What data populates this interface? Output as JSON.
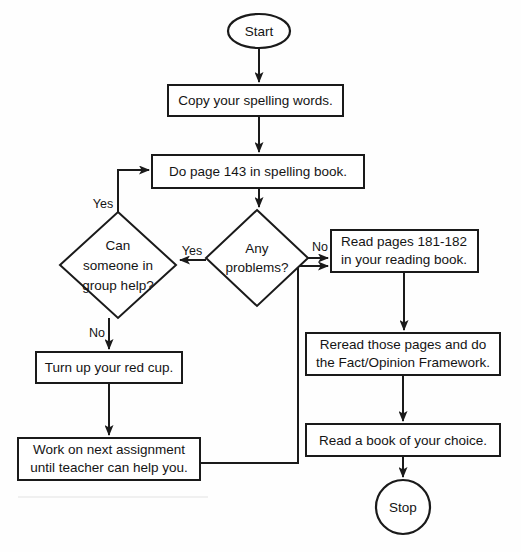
{
  "diagram": {
    "type": "flowchart",
    "orientation": "top-to-bottom",
    "background_color": "#fefefe",
    "line_color": "#1a1a1a",
    "fill_color": "#ffffff"
  },
  "nodes": [
    {
      "id": "start",
      "shape": "ellipse",
      "label": "Start",
      "cx": 259,
      "cy": 31,
      "rx": 31,
      "ry": 17
    },
    {
      "id": "copy-words",
      "shape": "rectangle",
      "label": "Copy your spelling words.",
      "x": 168,
      "y": 85,
      "w": 175,
      "h": 31
    },
    {
      "id": "do-page",
      "shape": "rectangle",
      "label": "Do page 143 in spelling book.",
      "x": 152,
      "y": 155,
      "w": 212,
      "h": 33
    },
    {
      "id": "any-problems",
      "shape": "diamond",
      "label_lines": [
        "Any",
        "problems?"
      ],
      "cx": 257,
      "cy": 258,
      "rx": 51,
      "ry": 48
    },
    {
      "id": "group-help",
      "shape": "diamond",
      "label_lines": [
        "Can",
        "someone in",
        "group help?"
      ],
      "cx": 118,
      "cy": 265,
      "rx": 58,
      "ry": 53
    },
    {
      "id": "read-pages",
      "shape": "rectangle",
      "label_lines": [
        "Read pages 181-182",
        "in your reading book."
      ],
      "x": 331,
      "y": 230,
      "w": 147,
      "h": 42
    },
    {
      "id": "reread-pages",
      "shape": "rectangle",
      "label_lines": [
        "Reread those pages and do",
        "the Fact/Opinion Framework."
      ],
      "x": 306,
      "y": 333,
      "w": 194,
      "h": 42
    },
    {
      "id": "read-choice",
      "shape": "rectangle",
      "label": "Read a book of your choice.",
      "x": 306,
      "y": 424,
      "w": 194,
      "h": 32
    },
    {
      "id": "turn-cup",
      "shape": "rectangle",
      "label": "Turn up your red cup.",
      "x": 36,
      "y": 352,
      "w": 146,
      "h": 31
    },
    {
      "id": "next-assignment",
      "shape": "rectangle",
      "label_lines": [
        "Work on next assignment",
        "until teacher can help you."
      ],
      "x": 18,
      "y": 438,
      "w": 182,
      "h": 42
    },
    {
      "id": "stop",
      "shape": "circle",
      "label": "Stop",
      "cx": 403,
      "cy": 507,
      "r": 27
    }
  ],
  "edges": [
    {
      "id": "start-to-copy",
      "from": "start",
      "to": "copy-words",
      "label": ""
    },
    {
      "id": "copy-to-dopage",
      "from": "copy-words",
      "to": "do-page",
      "label": ""
    },
    {
      "id": "dopage-to-problems",
      "from": "do-page",
      "to": "any-problems",
      "label": ""
    },
    {
      "id": "problems-yes-to-grouphelp",
      "from": "any-problems",
      "to": "group-help",
      "label": "Yes"
    },
    {
      "id": "problems-no-to-readpages",
      "from": "any-problems",
      "to": "read-pages",
      "label": "No"
    },
    {
      "id": "grouphelp-yes-to-dopage",
      "from": "group-help",
      "to": "do-page",
      "label": "Yes"
    },
    {
      "id": "grouphelp-no-to-turncup",
      "from": "group-help",
      "to": "turn-cup",
      "label": "No"
    },
    {
      "id": "turncup-to-nextassignment",
      "from": "turn-cup",
      "to": "next-assignment",
      "label": ""
    },
    {
      "id": "nextassignment-to-readpages",
      "from": "next-assignment",
      "to": "read-pages",
      "label": ""
    },
    {
      "id": "readpages-to-reread",
      "from": "read-pages",
      "to": "reread-pages",
      "label": ""
    },
    {
      "id": "reread-to-readchoice",
      "from": "reread-pages",
      "to": "read-choice",
      "label": ""
    },
    {
      "id": "readchoice-to-stop",
      "from": "read-choice",
      "to": "stop",
      "label": ""
    }
  ],
  "edge_labels": {
    "problems_yes": "Yes",
    "problems_no": "No",
    "grouphelp_yes": "Yes",
    "grouphelp_no": "No"
  }
}
